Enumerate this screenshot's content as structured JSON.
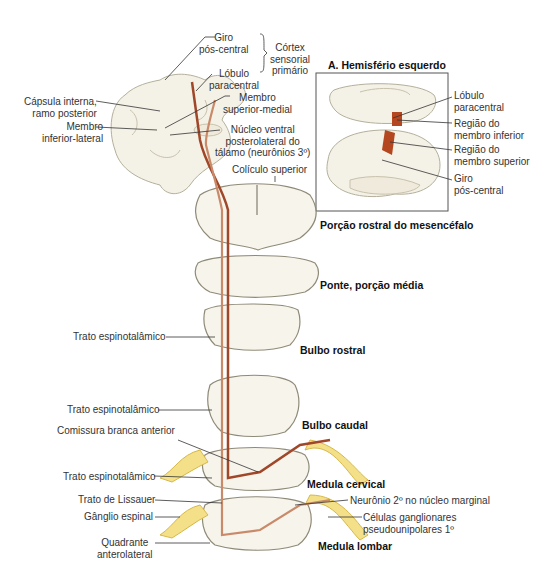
{
  "figure": {
    "inset_title": "A. Hemisfério esquerdo",
    "cortex": {
      "giro_pos_central": [
        "Giro",
        "pós-central"
      ],
      "lobulo_paracentral": [
        "Lóbulo",
        "paracentral"
      ],
      "cortex_sensorial": [
        "Córtex",
        "sensorial",
        "primário"
      ],
      "capsula_interna": [
        "Cápsula interna,",
        "ramo posterior"
      ],
      "membro_inferior_lateral": [
        "Membro",
        "inferior-lateral"
      ],
      "membro_superior_medial": [
        "Membro",
        "superior-medial"
      ],
      "nucleo_ventral": [
        "Núcleo ventral",
        "posterolateral do",
        "tálamo (neurônios 3º)"
      ],
      "coliculo_superior": "Colículo superior"
    },
    "inset": {
      "lobulo_paracentral": [
        "Lóbulo",
        "paracentral"
      ],
      "regiao_membro_inferior": [
        "Região do",
        "membro inferior"
      ],
      "regiao_membro_superior": [
        "Região do",
        "membro superior"
      ],
      "giro_pos_central": [
        "Giro",
        "pós-central"
      ]
    },
    "levels": {
      "mesencefalo": "Porção rostral do mesencéfalo",
      "ponte": "Ponte, porção média",
      "bulbo_rostral": "Bulbo rostral",
      "bulbo_caudal": "Bulbo caudal",
      "medula_cervical": "Medula cervical",
      "medula_lombar": "Medula lombar"
    },
    "left_labels": {
      "trato_1": "Trato espinotalâmico",
      "trato_2": "Trato espinotalâmico",
      "comissura": "Comissura branca anterior",
      "trato_3": "Trato espinotalâmico",
      "lissauer": "Trato de Lissauer",
      "ganglio": "Gânglio espinal",
      "quadrante": [
        "Quadrante",
        "anterolateral"
      ]
    },
    "right_labels": {
      "neuronio_2": "Neurônio 2º no núcleo marginal",
      "celulas": [
        "Células ganglionares",
        "pseudounipolares 1º"
      ]
    },
    "colors": {
      "tract": "#a0472a",
      "tract_light": "#c98a6a",
      "tissue": "#f7f4ec",
      "tissue_edge": "#8f8a78",
      "ganglion": "#f5e08a",
      "highlight": "#b4471f"
    }
  }
}
